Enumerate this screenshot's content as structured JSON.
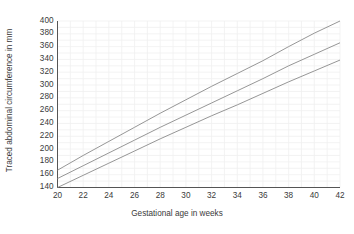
{
  "chart_data": {
    "type": "line",
    "title": "",
    "xlabel": "Gestational age in weeks",
    "ylabel": "Traced abdominal circumference in mm",
    "xlim": [
      20,
      42
    ],
    "ylim": [
      140,
      400
    ],
    "xticks": [
      20,
      22,
      24,
      26,
      28,
      30,
      32,
      34,
      36,
      38,
      40,
      42
    ],
    "yticks": [
      140,
      160,
      180,
      200,
      220,
      240,
      260,
      280,
      300,
      320,
      340,
      360,
      380,
      400
    ],
    "grid": "minor-and-major-light",
    "legend": "none",
    "x": [
      20,
      22,
      24,
      26,
      28,
      30,
      32,
      34,
      36,
      38,
      40,
      42
    ],
    "series": [
      {
        "name": "upper-reference-curve",
        "color": "#8a8a8a",
        "values": [
          167,
          190,
          212,
          234,
          256,
          277,
          298,
          318,
          338,
          360,
          381,
          400
        ]
      },
      {
        "name": "median-reference-curve",
        "color": "#8a8a8a",
        "values": [
          154,
          174,
          194,
          214,
          234,
          253,
          272,
          291,
          310,
          330,
          348,
          366
        ]
      },
      {
        "name": "lower-reference-curve",
        "color": "#8a8a8a",
        "values": [
          140,
          159,
          178,
          197,
          216,
          234,
          252,
          269,
          287,
          305,
          322,
          339
        ]
      }
    ]
  },
  "axis": {
    "line_color": "#555555",
    "grid_color": "#f0f0f0",
    "text_color": "#3a3a3a"
  }
}
